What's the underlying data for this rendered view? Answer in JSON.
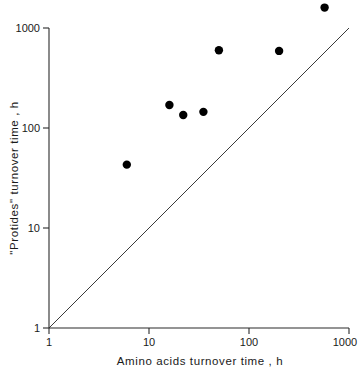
{
  "chart_data": {
    "type": "scatter",
    "title": "",
    "xlabel": "Amino acids turnover time , h",
    "ylabel": "\"Protides\" turnover time , h",
    "xscale": "log",
    "yscale": "log",
    "xlim": [
      1,
      1000
    ],
    "ylim": [
      1,
      1000
    ],
    "grid": false,
    "legend": null,
    "xticks": [
      1,
      10,
      100,
      1000
    ],
    "xticklabels": [
      "1",
      "10",
      "100",
      "1000"
    ],
    "yticks": [
      1,
      10,
      100,
      1000
    ],
    "yticklabels": [
      "1",
      "10",
      "100",
      "1000"
    ],
    "series": [
      {
        "name": "observations",
        "marker": "filled-circle",
        "color": "#000000",
        "points": [
          {
            "x": 6,
            "y": 43
          },
          {
            "x": 16,
            "y": 170
          },
          {
            "x": 22,
            "y": 135
          },
          {
            "x": 35,
            "y": 145
          },
          {
            "x": 50,
            "y": 600
          },
          {
            "x": 200,
            "y": 590
          },
          {
            "x": 570,
            "y": 1600
          }
        ]
      }
    ],
    "annotations": [
      {
        "type": "line",
        "name": "identity-line",
        "description": "y = x reference line",
        "from": {
          "x": 1,
          "y": 1
        },
        "to": {
          "x": 1000,
          "y": 1000
        }
      }
    ]
  },
  "axes": {
    "x_label": "Amino acids turnover time , h",
    "y_label": "\"Protides\" turnover time , h",
    "x_tick_labels": [
      "1",
      "10",
      "100",
      "1000"
    ],
    "y_tick_labels": [
      "1",
      "10",
      "100",
      "1000"
    ]
  }
}
